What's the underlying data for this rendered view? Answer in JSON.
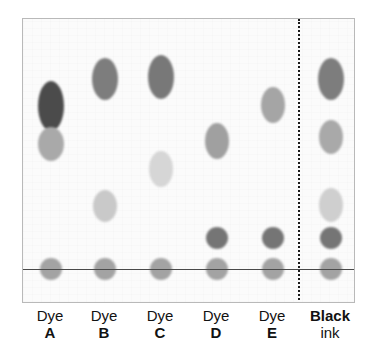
{
  "figure": {
    "plate": {
      "background_color": "#fbfbfb",
      "border_color": "#b9b9b9",
      "left": 22,
      "top": 18,
      "width": 333,
      "height": 285
    },
    "baseline": {
      "label": "baseline",
      "color": "#4a4a4a",
      "y": 268,
      "x_start": 22,
      "x_end": 355
    },
    "divider": {
      "label": "divider",
      "style": "dotted",
      "color": "#1a1a1a",
      "x": 297,
      "y_start": 18,
      "y_end": 303
    }
  },
  "chart_data": {
    "type": "scatter",
    "xlabel": "",
    "ylabel": "",
    "grid": false,
    "legend": "none",
    "x_categories": [
      "Dye A",
      "Dye B",
      "Dye C",
      "Dye D",
      "Dye E",
      "Black ink"
    ],
    "baseline_y_px": 268,
    "lanes": [
      {
        "name": "Dye A",
        "label_line1": "Dye",
        "label_line2": "A",
        "center_x": 50,
        "spot_count": 3,
        "spots": [
          {
            "name": "A1",
            "color": "#4b4b4b",
            "cx": 50,
            "cy": 105,
            "rx": 13,
            "ry": 25
          },
          {
            "name": "A2",
            "color": "#a9a9a9",
            "cx": 50,
            "cy": 143,
            "rx": 13,
            "ry": 17
          },
          {
            "name": "A-origin",
            "color": "#a3a3a3",
            "cx": 50,
            "cy": 268,
            "rx": 11,
            "ry": 11
          }
        ]
      },
      {
        "name": "Dye B",
        "label_line1": "Dye",
        "label_line2": "B",
        "center_x": 104,
        "spot_count": 3,
        "spots": [
          {
            "name": "B1",
            "color": "#7d7d7d",
            "cx": 104,
            "cy": 78,
            "rx": 13,
            "ry": 21
          },
          {
            "name": "B2",
            "color": "#c9c9c9",
            "cx": 104,
            "cy": 205,
            "rx": 12,
            "ry": 16
          },
          {
            "name": "B-origin",
            "color": "#a3a3a3",
            "cx": 104,
            "cy": 268,
            "rx": 11,
            "ry": 11
          }
        ]
      },
      {
        "name": "Dye C",
        "label_line1": "Dye",
        "label_line2": "C",
        "center_x": 160,
        "spot_count": 3,
        "spots": [
          {
            "name": "C1",
            "color": "#787878",
            "cx": 160,
            "cy": 76,
            "rx": 13,
            "ry": 22
          },
          {
            "name": "C2",
            "color": "#d6d6d6",
            "cx": 160,
            "cy": 168,
            "rx": 12,
            "ry": 18
          },
          {
            "name": "C-origin",
            "color": "#a3a3a3",
            "cx": 160,
            "cy": 268,
            "rx": 11,
            "ry": 11
          }
        ]
      },
      {
        "name": "Dye D",
        "label_line1": "Dye",
        "label_line2": "D",
        "center_x": 216,
        "spot_count": 3,
        "spots": [
          {
            "name": "D1",
            "color": "#a0a0a0",
            "cx": 216,
            "cy": 140,
            "rx": 12,
            "ry": 18
          },
          {
            "name": "D2",
            "color": "#757575",
            "cx": 216,
            "cy": 237,
            "rx": 11,
            "ry": 11
          },
          {
            "name": "D-origin",
            "color": "#a3a3a3",
            "cx": 216,
            "cy": 268,
            "rx": 11,
            "ry": 11
          }
        ]
      },
      {
        "name": "Dye E",
        "label_line1": "Dye",
        "label_line2": "E",
        "center_x": 272,
        "spot_count": 3,
        "spots": [
          {
            "name": "E1",
            "color": "#a5a5a5",
            "cx": 272,
            "cy": 104,
            "rx": 12,
            "ry": 18
          },
          {
            "name": "E2",
            "color": "#757575",
            "cx": 272,
            "cy": 237,
            "rx": 11,
            "ry": 11
          },
          {
            "name": "E-origin",
            "color": "#a3a3a3",
            "cx": 272,
            "cy": 268,
            "rx": 11,
            "ry": 11
          }
        ]
      },
      {
        "name": "Black ink",
        "label_line1": "Black",
        "label_line2": "ink",
        "center_x": 330,
        "spot_count": 5,
        "spots": [
          {
            "name": "K1",
            "color": "#7d7d7d",
            "cx": 330,
            "cy": 78,
            "rx": 13,
            "ry": 21
          },
          {
            "name": "K2",
            "color": "#a9a9a9",
            "cx": 330,
            "cy": 136,
            "rx": 12,
            "ry": 17
          },
          {
            "name": "K3",
            "color": "#cfcfcf",
            "cx": 330,
            "cy": 204,
            "rx": 12,
            "ry": 17
          },
          {
            "name": "K4",
            "color": "#757575",
            "cx": 330,
            "cy": 237,
            "rx": 11,
            "ry": 11
          },
          {
            "name": "K-origin",
            "color": "#a3a3a3",
            "cx": 330,
            "cy": 268,
            "rx": 11,
            "ry": 11
          }
        ]
      }
    ]
  }
}
